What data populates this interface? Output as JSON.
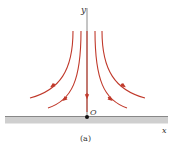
{
  "figure": {
    "caption": "(a)",
    "axis_y_label": "y",
    "axis_x_label": "x",
    "origin_label": "O",
    "colors": {
      "streamline": "#c0392b",
      "axis": "#8a8a8a",
      "ground": "#c8c8c8",
      "ground_edge": "#8a8a8a",
      "origin_dot": "#111111"
    },
    "streamlines": [
      {
        "name": "outer-left",
        "direction": "down-left"
      },
      {
        "name": "inner-left",
        "direction": "down-left"
      },
      {
        "name": "center",
        "direction": "down"
      },
      {
        "name": "inner-right",
        "direction": "down-right"
      },
      {
        "name": "outer-right",
        "direction": "down-right"
      }
    ]
  }
}
